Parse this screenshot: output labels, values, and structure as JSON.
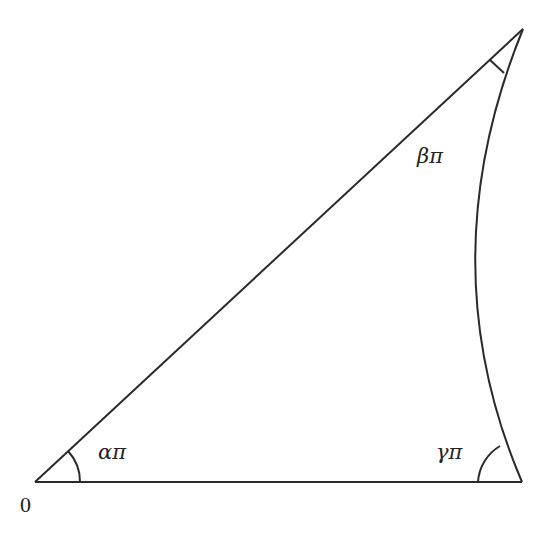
{
  "diagram": {
    "type": "hyperbolic-triangle",
    "vertices": {
      "origin": {
        "label": "0",
        "x": 35,
        "y": 482
      },
      "top": {
        "x": 523,
        "y": 29
      },
      "bottom_right": {
        "x": 522,
        "y": 482
      }
    },
    "angles": {
      "alpha": {
        "label": "απ",
        "at": "origin"
      },
      "beta": {
        "label": "βπ",
        "at": "top"
      },
      "gamma": {
        "label": "γπ",
        "at": "bottom_right"
      }
    },
    "edges": [
      {
        "from": "origin",
        "to": "top",
        "kind": "straight"
      },
      {
        "from": "origin",
        "to": "bottom_right",
        "kind": "straight"
      },
      {
        "from": "top",
        "to": "bottom_right",
        "kind": "circular-arc"
      }
    ],
    "colors": {
      "stroke": "#2a2a2a",
      "background": "#ffffff"
    }
  }
}
